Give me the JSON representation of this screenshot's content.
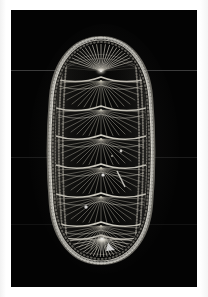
{
  "page": {
    "background_color": "#ffffff",
    "plate_background_color": "#030303",
    "margin_left_px": 11,
    "margin_top_px": 10,
    "photo_width_px": 186,
    "photo_height_px": 277
  },
  "photo": {
    "subject_name": "chiton-specimen",
    "subject_description": "Dorsal view of an elongate oval chiton (Polyplacophora) shell",
    "lighting": "dark-field",
    "highlight_color": "#f2f0ea",
    "midtone_color": "#9a968c",
    "shadow_color": "#1a1a19",
    "background_color": "#030303"
  },
  "specimen": {
    "outline_shape": "elongate-oval",
    "bounding_box": {
      "x": 45,
      "y": 35,
      "width": 112,
      "height": 231
    },
    "valve_count": 8,
    "valves": [
      {
        "index": 1,
        "name": "head-valve",
        "label": "Valve I",
        "pattern": "radial-fan",
        "y_center_pct": 9
      },
      {
        "index": 2,
        "name": "intermediate-valve-2",
        "label": "Valve II",
        "pattern": "chevron-ribs",
        "y_center_pct": 22
      },
      {
        "index": 3,
        "name": "intermediate-valve-3",
        "label": "Valve III",
        "pattern": "chevron-ribs",
        "y_center_pct": 33
      },
      {
        "index": 4,
        "name": "intermediate-valve-4",
        "label": "Valve IV",
        "pattern": "chevron-ribs",
        "y_center_pct": 44
      },
      {
        "index": 5,
        "name": "intermediate-valve-5",
        "label": "Valve V",
        "pattern": "chevron-ribs",
        "y_center_pct": 55
      },
      {
        "index": 6,
        "name": "intermediate-valve-6",
        "label": "Valve VI",
        "pattern": "chevron-ribs",
        "y_center_pct": 66
      },
      {
        "index": 7,
        "name": "intermediate-valve-7",
        "label": "Valve VII",
        "pattern": "chevron-ribs",
        "y_center_pct": 77
      },
      {
        "index": 8,
        "name": "tail-valve",
        "label": "Valve VIII",
        "pattern": "radial-fan",
        "y_center_pct": 90
      }
    ],
    "girdle": {
      "name": "girdle",
      "texture": "granular-beaded",
      "color": "#b9b5ab"
    }
  }
}
